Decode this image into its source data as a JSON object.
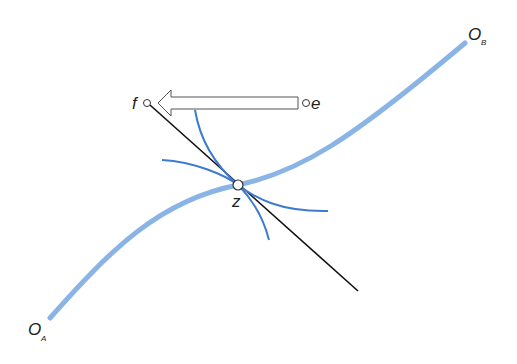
{
  "diagram": {
    "type": "edgeworth-box-contract-curve",
    "labels": {
      "origin_a": "O",
      "origin_a_sub": "A",
      "origin_b": "O",
      "origin_b_sub": "B",
      "point_f": "f",
      "point_e": "e",
      "point_z": "z"
    },
    "colors": {
      "contract_curve": "#8ab4e6",
      "indifference_curves": "#3d7bd1",
      "tangent_line": "#111111",
      "arrow_outline": "#555555",
      "text": "#231f20"
    }
  }
}
